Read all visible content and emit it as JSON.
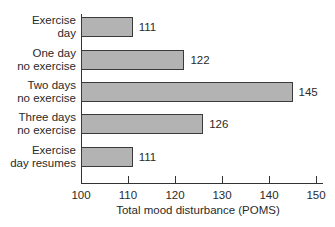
{
  "chart_data": {
    "type": "bar",
    "orientation": "horizontal",
    "title": "",
    "categories": [
      "Exercise day",
      "One day no exercise",
      "Two days no exercise",
      "Three days no exercise",
      "Exercise day resumes"
    ],
    "category_lines": [
      [
        "Exercise",
        "day"
      ],
      [
        "One day",
        "no exercise"
      ],
      [
        "Two days",
        "no exercise"
      ],
      [
        "Three days",
        "no exercise"
      ],
      [
        "Exercise",
        "day resumes"
      ]
    ],
    "values": [
      111,
      122,
      145,
      126,
      111
    ],
    "value_labels": [
      "111",
      "122",
      "145",
      "126",
      "111"
    ],
    "xlabel": "Total mood disturbance (POMS)",
    "ylabel": "",
    "xlim": [
      100,
      150
    ],
    "xticks": [
      "100",
      "110",
      "120",
      "130",
      "140",
      "150"
    ],
    "grid": false,
    "legend": null,
    "bar_color": "#b3b3b3",
    "bar_edge_color": "#3a3a3a"
  }
}
